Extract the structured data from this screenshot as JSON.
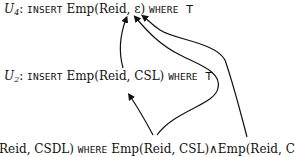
{
  "diagram": {
    "nodes": [
      {
        "id": "U4",
        "label": "U",
        "subscript": "4",
        "colon": ":",
        "keyword_insert": "INSERT",
        "tuple": "Emp(Reid, ε)",
        "keyword_where": "WHERE",
        "condition": "T"
      },
      {
        "id": "U2",
        "label": "U",
        "subscript": "2",
        "colon": ":",
        "keyword_insert": "INSERT",
        "tuple": "Emp(Reid, CSL)",
        "keyword_where": "WHERE",
        "condition": "T"
      },
      {
        "id": "U_bottom",
        "tuple_partial": "Reid, CSDL)",
        "keyword_where": "WHERE",
        "condition": "Emp(Reid, CSL)∧Emp(Reid, CSD)"
      }
    ],
    "edges": [
      {
        "from": "U2.Reid",
        "to": "U4.Reid"
      },
      {
        "from": "U_bottom.Emp(Reid, CSL)",
        "to": "U2.CSL"
      },
      {
        "from": "U_bottom.Emp(Reid, CSL)",
        "to": "U4.ε"
      },
      {
        "from": "U_bottom.Emp(Reid, CSD)",
        "to": "U4.ε"
      }
    ],
    "stroke_color": "#111111"
  }
}
